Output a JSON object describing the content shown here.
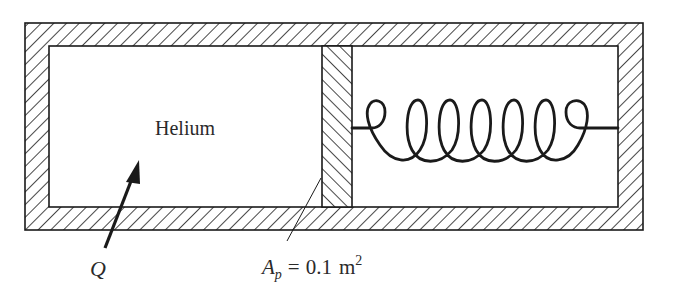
{
  "diagram": {
    "type": "piston-cylinder with spring",
    "gas_label": "Helium",
    "heat_label": "Q",
    "area_label": {
      "symbol": "A",
      "subscript": "p",
      "equals": "=",
      "value": "0.1",
      "unit": "m",
      "unit_exponent": "2"
    },
    "components": [
      "cylinder-wall",
      "piston",
      "spring",
      "heat-arrow",
      "leader-line"
    ],
    "colors": {
      "stroke": "#1a1a1a",
      "background": "#ffffff",
      "text": "#2a2a2a"
    }
  }
}
